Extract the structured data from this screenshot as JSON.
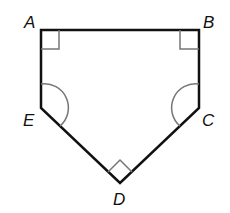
{
  "figure": {
    "type": "pentagon",
    "vertices": [
      "A",
      "B",
      "C",
      "D",
      "E"
    ],
    "labels": {
      "A": "A",
      "B": "B",
      "C": "C",
      "D": "D",
      "E": "E"
    },
    "right_angles": [
      "A",
      "B",
      "D"
    ],
    "congruent_angle_arcs": [
      "C",
      "E"
    ],
    "stroke_color": "#111111",
    "marker_color": "#777777"
  }
}
